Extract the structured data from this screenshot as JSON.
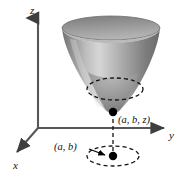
{
  "figure": {
    "kind": "3d-coordinate-diagram",
    "background_color": "#ffffff"
  },
  "axes": {
    "origin": {
      "x": 38,
      "y": 128
    },
    "z": {
      "label": "z",
      "direction": "up",
      "tip": {
        "x": 38,
        "y": 13
      },
      "color": "#4d4d4d"
    },
    "y": {
      "label": "y",
      "direction": "right",
      "tip": {
        "x": 170,
        "y": 128
      },
      "color": "#4d4d4d"
    },
    "x": {
      "label": "x",
      "direction": "down-left",
      "tip": {
        "x": 12,
        "y": 155
      },
      "color": "#4d4d4d"
    }
  },
  "surface": {
    "name": "funnel",
    "shape": "cone opening upward",
    "top_rim": {
      "cx": 111,
      "cy": 28,
      "rx": 49,
      "ry": 12
    },
    "vertex": {
      "x": 113,
      "y": 112
    },
    "fill_light": "#d0d0d0",
    "fill_mid": "#9a9a9a",
    "fill_dark": "#6e6e6e",
    "rim_top_color": "#8a8a8a",
    "rim_inner_color": "#707070"
  },
  "dashed_circles": [
    {
      "name": "cross-section-circle",
      "cx": 115,
      "cy": 89,
      "rx": 28,
      "ry": 11,
      "color": "#1a1a1a",
      "dash": "4 3"
    },
    {
      "name": "projection-circle",
      "cx": 113,
      "cy": 156,
      "rx": 26,
      "ry": 10,
      "color": "#1a1a1a",
      "dash": "4 3"
    }
  ],
  "dashed_line": {
    "name": "vertical-projection-line",
    "from": {
      "x": 113,
      "y": 112
    },
    "to": {
      "x": 113,
      "y": 156
    },
    "color": "#1a1a1a",
    "dash": "4 3"
  },
  "points": [
    {
      "name": "surface-vertex-point",
      "x": 113,
      "y": 112,
      "r": 4.2,
      "color": "#000000",
      "label": "(a, b, z)"
    },
    {
      "name": "projection-point",
      "x": 113,
      "y": 156,
      "r": 4.2,
      "color": "#000000",
      "label": "(a, b)"
    }
  ],
  "leader_line": {
    "name": "ab-leader-arrow",
    "from": {
      "x": 90,
      "y": 149
    },
    "to": {
      "x": 107,
      "y": 156
    },
    "color": "#000000"
  },
  "labels": {
    "z_axis": "z",
    "y_axis": "y",
    "x_axis": "x",
    "vertex_point": "(a, b, z)",
    "projection_point": "(a, b)"
  }
}
